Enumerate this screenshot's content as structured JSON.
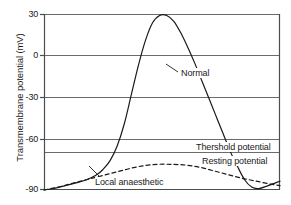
{
  "chart_data": {
    "type": "line",
    "title": "",
    "xlabel": "",
    "ylabel": "Transmembrane potential (mV)",
    "ylim": [
      -90,
      30
    ],
    "xlim": [
      0,
      100
    ],
    "yticks": [
      30,
      0,
      -30,
      -60,
      -90
    ],
    "ytick_labels": [
      "30",
      "0",
      "-30",
      "-60",
      "-90"
    ],
    "xticks": [],
    "xtick_labels": [],
    "grid": true,
    "grid_axis": "y",
    "legend_position": "inline-annotations",
    "reference_lines": [
      {
        "name": "threshold",
        "label": "Thershold potential",
        "value": -67
      },
      {
        "name": "resting",
        "label": "Resting potential",
        "value": -90
      }
    ],
    "annotations": [
      {
        "name": "normal",
        "text": "Normal",
        "style": "solid",
        "leader": true
      },
      {
        "name": "threshold",
        "text": "Thershold potential",
        "style": "line",
        "leader": false
      },
      {
        "name": "resting",
        "text": "Resting potential",
        "style": "line",
        "leader": false
      },
      {
        "name": "local-anaesthetic",
        "text": "Local anaesthetic",
        "style": "dashed",
        "leader": true
      }
    ],
    "series": [
      {
        "name": "Normal",
        "label": "Normal",
        "style": "solid",
        "color": "#1a1a1a",
        "x": [
          0,
          4,
          9,
          14,
          18,
          22,
          25,
          28,
          31,
          34,
          37,
          40,
          43,
          46,
          49,
          52,
          55,
          58,
          61,
          64,
          67,
          70,
          73,
          76,
          79,
          82,
          85,
          88,
          91,
          95,
          100
        ],
        "y": [
          -90,
          -89,
          -87,
          -85,
          -83,
          -80,
          -76,
          -70,
          -60,
          -45,
          -25,
          -5,
          12,
          24,
          29,
          29,
          25,
          17,
          7,
          -4,
          -16,
          -28,
          -40,
          -52,
          -64,
          -74,
          -83,
          -88,
          -89,
          -87,
          -84
        ]
      },
      {
        "name": "Local anaesthetic",
        "label": "Local anaesthetic",
        "style": "dashed",
        "color": "#1a1a1a",
        "x": [
          0,
          6,
          12,
          18,
          24,
          30,
          36,
          42,
          48,
          54,
          60,
          66,
          72,
          78,
          84,
          90,
          96,
          100
        ],
        "y": [
          -90,
          -88,
          -85.5,
          -83,
          -80.5,
          -78,
          -75.5,
          -73.5,
          -72.5,
          -72.5,
          -73,
          -74.5,
          -77,
          -79.5,
          -82,
          -84,
          -86,
          -87
        ]
      }
    ]
  },
  "axis": {
    "ylabel": "Transmembrane potential (mV)",
    "ticks": [
      {
        "value": 30,
        "label": "30"
      },
      {
        "value": 0,
        "label": "0"
      },
      {
        "value": -30,
        "label": "-30"
      },
      {
        "value": -60,
        "label": "-60"
      },
      {
        "value": -90,
        "label": "-90"
      }
    ]
  },
  "labels": {
    "normal": "Normal",
    "threshold": "Thershold potential",
    "resting": "Resting potential",
    "local_anaesthetic": "Local anaesthetic"
  },
  "colors": {
    "curve": "#1a1a1a",
    "grid": "#6b6b6b",
    "frame": "#4d4d4d",
    "text": "#1a1a1a",
    "background": "#ffffff"
  }
}
